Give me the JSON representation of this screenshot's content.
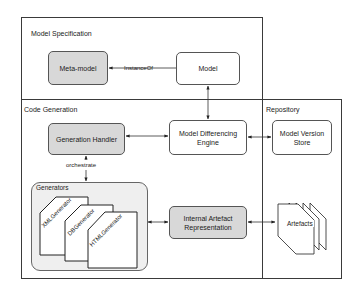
{
  "regions": {
    "model_specification": "Model Specification",
    "code_generation": "Code Generation",
    "repository": "Repository"
  },
  "nodes": {
    "meta_model": "Meta-model",
    "model": "Model",
    "generation_handler": "Generation Handler",
    "model_differencing_engine": [
      "Model Differencing",
      "Engine"
    ],
    "model_version_store": [
      "Model Version",
      "Store"
    ],
    "internal_artefact_representation": [
      "Internal Artefact",
      "Representation"
    ],
    "artefacts": "Artefacts"
  },
  "generators": {
    "title": "Generators",
    "items": [
      "XMLGenerator",
      "DBGenerator",
      "HTMLGenerator"
    ]
  },
  "edges": {
    "instance_of": "InstanceOf",
    "orchestrate": "orchestrate"
  },
  "colors": {
    "grey_fill": "#d8d8d8",
    "group_fill": "#efefef",
    "border": "#3a3a3a"
  }
}
